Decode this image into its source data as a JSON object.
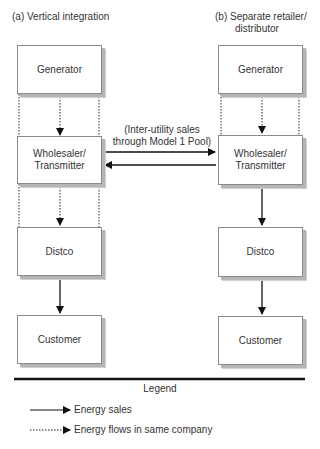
{
  "panels": {
    "left": {
      "title": "(a) Vertical integration",
      "boxes": [
        "Generator",
        "Wholesaler/\nTransmitter",
        "Distco",
        "Customer"
      ]
    },
    "right": {
      "title_line1": "(b) Separate retailer/",
      "title_line2": "distributor",
      "boxes": [
        "Generator",
        "Wholesaler/\nTransmitter",
        "Distco",
        "Customer"
      ]
    }
  },
  "inter_utility": {
    "line1": "(Inter-utility sales",
    "line2": "through Model 1 Pool)"
  },
  "legend": {
    "title": "Legend",
    "items": [
      {
        "style": "solid",
        "label": "Energy sales"
      },
      {
        "style": "dotted",
        "label": "Energy flows in same company"
      }
    ]
  },
  "colors": {
    "line": "#111111",
    "box_border": "#8a8a8a",
    "shadow": "#b5b5b5"
  }
}
